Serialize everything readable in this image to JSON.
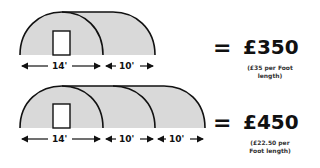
{
  "options": [
    {
      "sections": [
        {
          "label": "14'",
          "is_front_with_door": true
        },
        {
          "label": "10'"
        }
      ],
      "equals": "=",
      "price": "£350",
      "note_line1": "(£35 per Foot",
      "note_line2": "length)"
    },
    {
      "sections": [
        {
          "label": "14'",
          "is_front_with_door": true
        },
        {
          "label": "10'"
        },
        {
          "label": "10'"
        }
      ],
      "equals": "=",
      "price": "£450",
      "note_line1": "(£22.50 per",
      "note_line2": "Foot length)"
    }
  ],
  "colors": {
    "tunnel_fill": "#d9d9d9",
    "outline": "#111111",
    "door_fill": "#ffffff"
  }
}
